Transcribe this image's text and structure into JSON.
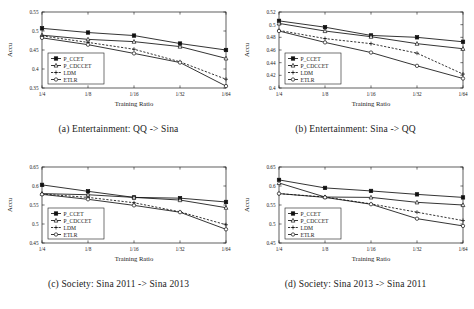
{
  "figure": {
    "y_axis_label": "Accu",
    "x_axis_label": "Training Ratio",
    "categories": [
      "1/4",
      "1/8",
      "1/16",
      "1/32",
      "1/64"
    ],
    "legend": [
      {
        "name": "P_CCET",
        "marker": "filled-square",
        "line": "solid"
      },
      {
        "name": "P_CDCCET",
        "marker": "open-triangle",
        "line": "solid"
      },
      {
        "name": "LDM",
        "marker": "plus",
        "line": "dashed"
      },
      {
        "name": "ETLR",
        "marker": "open-circle",
        "line": "solid"
      }
    ]
  },
  "chart_data": [
    {
      "type": "line",
      "id": "panel-a",
      "title": "(a) Entertainment: QQ -> Sina",
      "xlabel": "Training Ratio",
      "ylabel": "Accu",
      "categories": [
        "1/4",
        "1/8",
        "1/16",
        "1/32",
        "1/64"
      ],
      "ylim": [
        0.35,
        0.55
      ],
      "yticks": [
        0.35,
        0.4,
        0.45,
        0.5,
        0.55
      ],
      "grid": false,
      "legend_position": "lower-left",
      "series": [
        {
          "name": "P_CCET",
          "marker": "filled-square",
          "line": "solid",
          "values": [
            0.507,
            0.496,
            0.488,
            0.467,
            0.45
          ]
        },
        {
          "name": "P_CDCCET",
          "marker": "open-triangle",
          "line": "solid",
          "values": [
            0.489,
            0.478,
            0.472,
            0.459,
            0.428
          ]
        },
        {
          "name": "LDM",
          "marker": "plus",
          "line": "dashed",
          "values": [
            0.487,
            0.47,
            0.452,
            0.419,
            0.373
          ]
        },
        {
          "name": "ETLR",
          "marker": "open-circle",
          "line": "solid",
          "values": [
            0.482,
            0.464,
            0.441,
            0.417,
            0.355
          ]
        }
      ]
    },
    {
      "type": "line",
      "id": "panel-b",
      "title": "(b) Entertainment: Sina -> QQ",
      "xlabel": "Training Ratio",
      "ylabel": "Accu",
      "categories": [
        "1/4",
        "1/8",
        "1/16",
        "1/32",
        "1/64"
      ],
      "ylim": [
        0.4,
        0.52
      ],
      "yticks": [
        0.4,
        0.42,
        0.44,
        0.46,
        0.48,
        0.5,
        0.52
      ],
      "grid": false,
      "legend_position": "lower-left",
      "series": [
        {
          "name": "P_CCET",
          "marker": "filled-square",
          "line": "solid",
          "values": [
            0.506,
            0.496,
            0.483,
            0.48,
            0.473
          ]
        },
        {
          "name": "P_CDCCET",
          "marker": "open-triangle",
          "line": "solid",
          "values": [
            0.502,
            0.49,
            0.481,
            0.47,
            0.462
          ]
        },
        {
          "name": "LDM",
          "marker": "plus",
          "line": "dashed",
          "values": [
            0.491,
            0.478,
            0.47,
            0.455,
            0.422
          ]
        },
        {
          "name": "ETLR",
          "marker": "open-circle",
          "line": "solid",
          "values": [
            0.49,
            0.472,
            0.456,
            0.435,
            0.415
          ]
        }
      ]
    },
    {
      "type": "line",
      "id": "panel-c",
      "title": "(c) Society: Sina 2011 -> Sina 2013",
      "xlabel": "Training Ratio",
      "ylabel": "Accu",
      "categories": [
        "1/4",
        "1/8",
        "1/16",
        "1/32",
        "1/64"
      ],
      "ylim": [
        0.45,
        0.65
      ],
      "yticks": [
        0.45,
        0.5,
        0.55,
        0.6,
        0.65
      ],
      "grid": false,
      "legend_position": "lower-left",
      "series": [
        {
          "name": "P_CCET",
          "marker": "filled-square",
          "line": "solid",
          "values": [
            0.603,
            0.586,
            0.57,
            0.568,
            0.558
          ]
        },
        {
          "name": "P_CDCCET",
          "marker": "open-triangle",
          "line": "solid",
          "values": [
            0.58,
            0.577,
            0.57,
            0.563,
            0.543
          ]
        },
        {
          "name": "LDM",
          "marker": "plus",
          "line": "dashed",
          "values": [
            0.579,
            0.57,
            0.556,
            0.532,
            0.498
          ]
        },
        {
          "name": "ETLR",
          "marker": "open-circle",
          "line": "solid",
          "values": [
            0.578,
            0.565,
            0.549,
            0.531,
            0.486
          ]
        }
      ]
    },
    {
      "type": "line",
      "id": "panel-d",
      "title": "(d) Society: Sina 2013 -> Sina 2011",
      "xlabel": "Training Ratio",
      "ylabel": "Accu",
      "categories": [
        "1/4",
        "1/8",
        "1/16",
        "1/32",
        "1/64"
      ],
      "ylim": [
        0.45,
        0.65
      ],
      "yticks": [
        0.45,
        0.5,
        0.55,
        0.6,
        0.65
      ],
      "grid": false,
      "legend_position": "lower-left",
      "series": [
        {
          "name": "P_CCET",
          "marker": "filled-square",
          "line": "solid",
          "values": [
            0.616,
            0.595,
            0.587,
            0.578,
            0.57
          ]
        },
        {
          "name": "P_CDCCET",
          "marker": "open-triangle",
          "line": "solid",
          "values": [
            0.608,
            0.571,
            0.57,
            0.557,
            0.55
          ]
        },
        {
          "name": "LDM",
          "marker": "plus",
          "line": "dashed",
          "values": [
            0.58,
            0.571,
            0.553,
            0.531,
            0.509
          ]
        },
        {
          "name": "ETLR",
          "marker": "open-circle",
          "line": "solid",
          "values": [
            0.58,
            0.57,
            0.552,
            0.514,
            0.495
          ]
        }
      ]
    }
  ]
}
